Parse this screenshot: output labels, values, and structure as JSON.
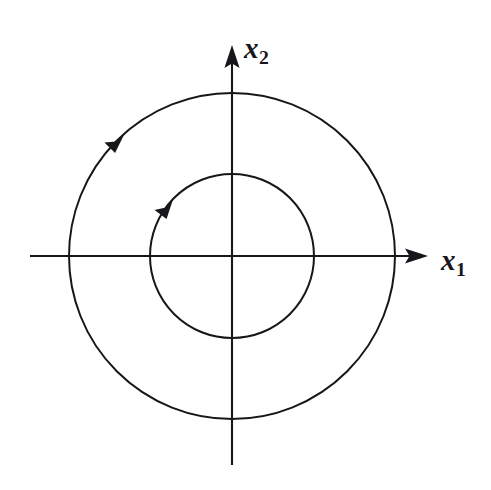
{
  "figure": {
    "background_color": "#ffffff",
    "stroke_color": "#17161a",
    "width": 491,
    "height": 490
  },
  "axes": {
    "origin": {
      "x": 232,
      "y": 256
    },
    "horizontal": {
      "name": "x1",
      "label_main": "x",
      "label_sub": "1",
      "start_x": 30,
      "end_x": 428,
      "y": 256,
      "arrow_direction": "right"
    },
    "vertical": {
      "name": "x2",
      "label_main": "x",
      "label_sub": "2",
      "start_y": 465,
      "end_y": 45,
      "x": 232,
      "arrow_direction": "up"
    }
  },
  "chart_data": {
    "type": "line",
    "xlabel": "x1",
    "ylabel": "x2",
    "grid": false,
    "legend": "none",
    "center": {
      "x": 232,
      "y": 256
    },
    "xlim": [
      -202,
      196
    ],
    "ylim": [
      -209,
      211
    ],
    "series": [
      {
        "name": "outer-orbit",
        "shape": "circle",
        "radius": 163,
        "direction": "counterclockwise",
        "arrow_angle_deg": 135,
        "arrow_position": {
          "x": 324,
          "y": 140
        }
      },
      {
        "name": "inner-orbit",
        "shape": "circle",
        "radius": 82,
        "direction": "counterclockwise",
        "arrow_angle_deg": 143,
        "arrow_position": {
          "x": 280,
          "y": 198
        }
      }
    ]
  },
  "labels": {
    "x2": {
      "main": "x",
      "sub": "2"
    },
    "x1": {
      "main": "x",
      "sub": "1"
    }
  }
}
